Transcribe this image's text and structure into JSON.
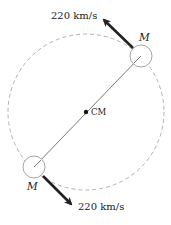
{
  "diagram": {
    "type": "binary-orbit",
    "orbit": {
      "style": "dashed",
      "color": "#a8a8a8"
    },
    "center_of_mass": {
      "label": "CM"
    },
    "bodies": [
      {
        "label": "M",
        "velocity_label": "220 km/s",
        "position": "upper-right"
      },
      {
        "label": "M",
        "velocity_label": "220 km/s",
        "position": "lower-left"
      }
    ],
    "colors": {
      "arrow": "#222222",
      "connector": "#555555",
      "body_outline": "#9a9a9a",
      "text": "#1a1a1a"
    }
  }
}
